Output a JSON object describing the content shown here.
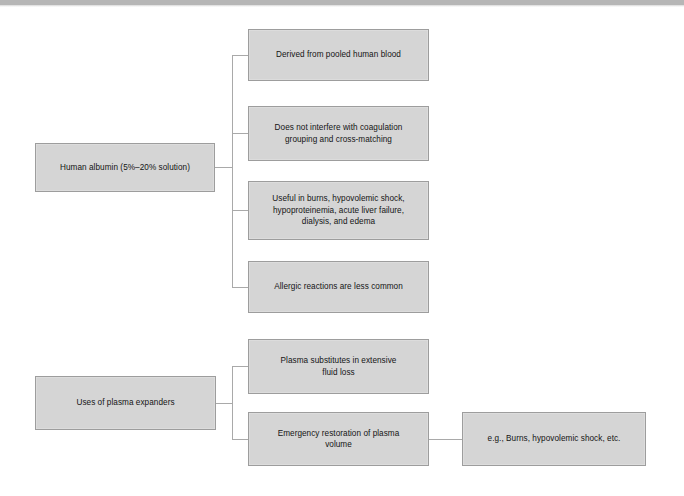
{
  "page": {
    "background_color": "#ffffff",
    "top_bar_color": "#b6b6b6",
    "node_fill_color": "#d5d5d5",
    "node_border_color": "#9d9d9d",
    "connector_color": "#a9a9a9",
    "text_color": "#141414"
  },
  "diagram": {
    "type": "flowchart",
    "orientation": "left-to-right",
    "groups": [
      {
        "id": "human-albumin",
        "root_label": "Human albumin (5%–20% solution)",
        "children": [
          {
            "id": "derived",
            "label": "Derived from pooled human blood"
          },
          {
            "id": "coagulation",
            "label": "Does not interfere with coagulation\ngrouping and cross-matching"
          },
          {
            "id": "useful",
            "label": "Useful in burns, hypovolemic shock,\nhypoproteinemia, acute liver failure,\ndialysis, and edema"
          },
          {
            "id": "allergic",
            "label": "Allergic reactions are less common"
          }
        ]
      },
      {
        "id": "plasma-expanders",
        "root_label": "Uses of plasma expanders",
        "children": [
          {
            "id": "substitutes",
            "label": "Plasma substitutes in extensive\nfluid loss"
          },
          {
            "id": "emergency",
            "label": "Emergency restoration of plasma\nvolume",
            "children": [
              {
                "id": "examples",
                "label": "e.g., Burns, hypovolemic shock, etc."
              }
            ]
          }
        ]
      }
    ]
  }
}
